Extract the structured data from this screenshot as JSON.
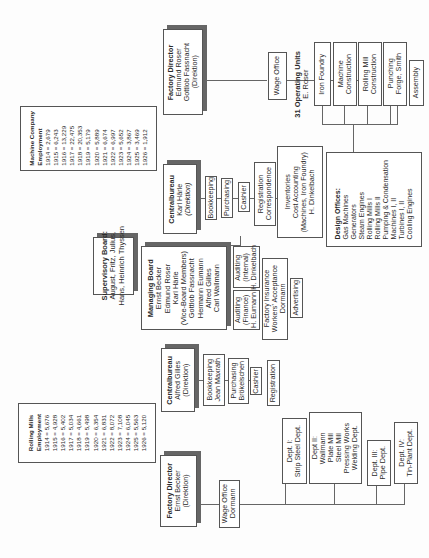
{
  "machine_company": {
    "factory_director": {
      "title": "Factory Director",
      "names": [
        "Edmund Roser",
        "Gottlob Fassnacht"
      ],
      "role": "(Direktion)"
    },
    "wage_office": "Wage Office",
    "centralbureau": {
      "title": "Centralbureau",
      "name": "Karl Härle",
      "role": "(Direktion)"
    },
    "centralbureau_units": [
      "Bookkeeping",
      "Purchasing",
      "Cashier"
    ],
    "registration": [
      "Registration",
      "Correspondence"
    ],
    "inventories": [
      "Inventories",
      "Cost Accounting",
      "(Machines, Iron Foundry)",
      "H. Dinkelbach"
    ],
    "operating_units": {
      "title": "31 Operating Units",
      "head": "E. Roser"
    },
    "units": [
      [
        "Iron Foundry"
      ],
      [
        "Machine",
        "Construction"
      ],
      [
        "Rolling Mill",
        "Construction"
      ],
      [
        "Punching",
        "Forge, Smith"
      ],
      [
        "Assembly"
      ]
    ],
    "design_offices": {
      "title": "Design Offices:",
      "items": [
        "Gas Machines",
        "Generators",
        "Steam Engines",
        "Rolling Mills I",
        "Rolling Mills II",
        "Pumping & Condensation",
        "Machines I, II",
        "Turbines I, II",
        "Cooling Engines"
      ]
    },
    "employment": {
      "title": "Machine Company",
      "subtitle": "Employment",
      "rows": [
        "1914 = 2,679",
        "1915 = 6,243",
        "1916 = 13,229",
        "1917 = 22,475",
        "1918 = 20,353",
        "1919 = 5,179",
        "1920 = 5,889",
        "1921 = 6,674",
        "1922 = 6,997",
        "1923 = 5,652",
        "1924 = 3,867",
        "1925 = 3,469",
        "1926 = 1,912"
      ]
    }
  },
  "boards": {
    "supervisory": {
      "title": "Supervisory Board:",
      "lines": [
        "August, Fritz, Julius,",
        "Hans, Heinrich Thyssen"
      ]
    },
    "managing": {
      "title": "Managing Board",
      "lines": [
        "Ernst Becker",
        "Edmund Roser",
        "Karl Härle",
        "(Vice-Board Members)",
        "Gottlob Fassnacht",
        "Hermann Eumann",
        "Alfred Gilles",
        "Carl Wallmann"
      ]
    },
    "auditing_finance": [
      "Auditing",
      "(Finance)",
      "H. Eumann"
    ],
    "auditing_internal": [
      "Auditing",
      "(Internal)",
      "H. Dinkelbach"
    ],
    "factory_insurance": [
      "Factory Insurance",
      "Workers' Acceptance",
      "Dormann"
    ],
    "advertising": "Advertising"
  },
  "rolling_mills": {
    "factory_director": {
      "title": "Factory Director",
      "name": "Ernst Becker",
      "role": "(Direktion)"
    },
    "wage_office": [
      "Wage Office",
      "Dormann"
    ],
    "centralbureau": {
      "title": "Centralbureau",
      "name": "Alfred Gilles",
      "role": "(Direktion)"
    },
    "bookkeeping": [
      "Bookkeeping",
      "Jean Maxrath"
    ],
    "purchasing": [
      "Purchasing",
      "Brökelschen"
    ],
    "cashier": "Cashier",
    "registration": "Registration",
    "departments": [
      [
        "Dept. I:",
        "Strip Steel Dept."
      ],
      [
        "Dept II:",
        "Wallmann",
        "Plate Mill",
        "Steel Mill",
        "Pressing Works",
        "Welding Dept."
      ],
      [
        "Dept. III:",
        "Pipe Dept."
      ],
      [
        "Dept. IV:",
        "Tin-Plant Dept."
      ]
    ],
    "employment": {
      "title": "Rolling Mills",
      "subtitle": "Employment",
      "rows": [
        "1914 = 5,676",
        "1915 = 4,928",
        "1916 = 5,402",
        "1917 = 5,034",
        "1918 = 4,661",
        "1919 = 5,498",
        "1920 = 6,354",
        "1921 = 6,831",
        "1922 = 8,072",
        "1923 = 7,108",
        "1924 = 6,045",
        "1925 = 5,563",
        "1926 = 5,120"
      ]
    }
  }
}
